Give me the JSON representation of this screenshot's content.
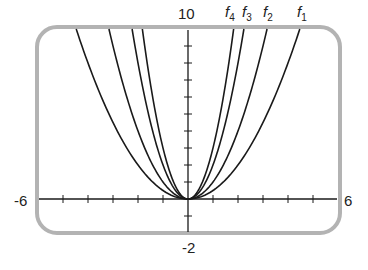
{
  "chart_data": {
    "type": "line",
    "title": "",
    "xlabel": "",
    "ylabel": "",
    "xlim": [
      -6,
      6
    ],
    "ylim": [
      -2,
      10
    ],
    "x_tick_step": 1,
    "y_tick_step": 1,
    "grid": false,
    "legend_position": "curve labels at top edge",
    "axis_labels": {
      "xmin": "-6",
      "xmax": "6",
      "ymin": "-2",
      "ymax": "10"
    },
    "series": [
      {
        "name": "f1",
        "label_main": "f",
        "label_sub": "1",
        "formula": "0.5*x^2",
        "coef": 0.5
      },
      {
        "name": "f2",
        "label_main": "f",
        "label_sub": "2",
        "formula": "x^2",
        "coef": 1
      },
      {
        "name": "f3",
        "label_main": "f",
        "label_sub": "3",
        "formula": "2*x^2",
        "coef": 2
      },
      {
        "name": "f4",
        "label_main": "f",
        "label_sub": "4",
        "formula": "3*x^2",
        "coef": 3
      }
    ]
  },
  "colors": {
    "frame": "#b3b3b3",
    "curve": "#1a1a1a",
    "axis": "#1a1a1a"
  }
}
